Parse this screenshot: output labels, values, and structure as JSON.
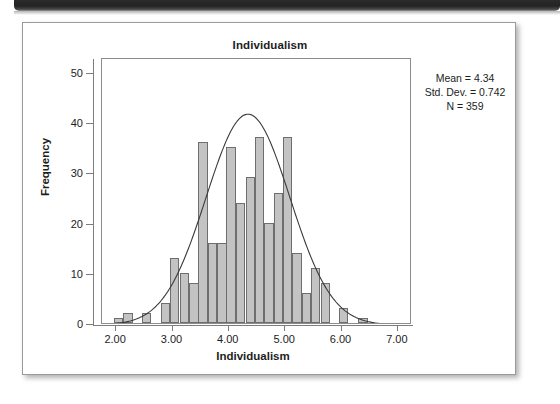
{
  "figure": {
    "title": "Individualism"
  },
  "stats": {
    "mean_label": "Mean = 4.34",
    "sd_label": "Std. Dev. = 0.742",
    "n_label": "N = 359"
  },
  "chart_data": {
    "type": "bar",
    "subtype": "histogram-with-normal-curve",
    "title": "Individualism",
    "xlabel": "Individualism",
    "ylabel": "Frequency",
    "xlim": [
      1.75,
      7.25
    ],
    "ylim": [
      0,
      53
    ],
    "grid": false,
    "legend": null,
    "xticks": [
      "2.00",
      "3.00",
      "4.00",
      "5.00",
      "6.00",
      "7.00"
    ],
    "xtick_values": [
      2.0,
      3.0,
      4.0,
      5.0,
      6.0,
      7.0
    ],
    "yticks": [
      "0",
      "10",
      "20",
      "30",
      "40",
      "50"
    ],
    "ytick_values": [
      0,
      10,
      20,
      30,
      40,
      50
    ],
    "bin_width": 0.1667,
    "bar_color": "#c3c3c3",
    "bar_edge_color": "#6e6e6e",
    "curve_color": "#3a3a3a",
    "statistics": {
      "mean": 4.34,
      "std_dev": 0.742,
      "n": 359
    },
    "bins": [
      {
        "x": 2.04,
        "value": 1
      },
      {
        "x": 2.21,
        "value": 2
      },
      {
        "x": 2.54,
        "value": 2
      },
      {
        "x": 2.88,
        "value": 4
      },
      {
        "x": 3.04,
        "value": 13
      },
      {
        "x": 3.21,
        "value": 10
      },
      {
        "x": 3.38,
        "value": 8
      },
      {
        "x": 3.54,
        "value": 36
      },
      {
        "x": 3.71,
        "value": 16
      },
      {
        "x": 3.88,
        "value": 16
      },
      {
        "x": 4.04,
        "value": 35
      },
      {
        "x": 4.21,
        "value": 24
      },
      {
        "x": 4.38,
        "value": 29
      },
      {
        "x": 4.54,
        "value": 37
      },
      {
        "x": 4.71,
        "value": 20
      },
      {
        "x": 4.88,
        "value": 26
      },
      {
        "x": 5.04,
        "value": 37
      },
      {
        "x": 5.21,
        "value": 14
      },
      {
        "x": 5.38,
        "value": 6
      },
      {
        "x": 5.54,
        "value": 11
      },
      {
        "x": 5.71,
        "value": 8
      },
      {
        "x": 6.04,
        "value": 3
      },
      {
        "x": 6.38,
        "value": 1
      }
    ],
    "normal_curve": {
      "peak_value": 42,
      "peak_x": 4.4,
      "description": "normal distribution overlay"
    }
  }
}
